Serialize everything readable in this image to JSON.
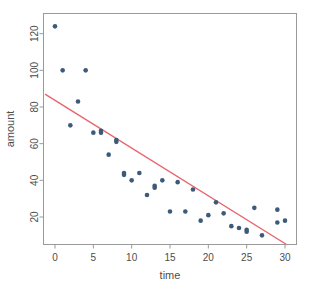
{
  "chart_data": {
    "type": "scatter",
    "title": "",
    "xlabel": "time",
    "ylabel": "amount",
    "xlim": [
      -1.5,
      31.5
    ],
    "ylim": [
      5,
      131
    ],
    "grid": false,
    "legend": null,
    "point_color": "#3d5a78",
    "line_color": "#e8646e",
    "frame_color": "#9a9a9a",
    "text_color": "#4d4d4d",
    "background": "#ffffff",
    "xticks": [
      0,
      5,
      10,
      15,
      20,
      25,
      30
    ],
    "xtick_labels": [
      "0",
      "5",
      "10",
      "15",
      "20",
      "25",
      "30"
    ],
    "yticks": [
      20,
      40,
      60,
      80,
      100,
      120
    ],
    "ytick_labels": [
      "20",
      "40",
      "60",
      "80",
      "100",
      "120"
    ],
    "x": [
      0,
      1,
      2,
      3,
      4,
      5,
      6,
      6,
      7,
      8,
      8,
      9,
      9,
      10,
      11,
      12,
      13,
      13,
      14,
      15,
      16,
      17,
      18,
      19,
      20,
      21,
      22,
      23,
      24,
      25,
      25,
      26,
      27,
      29,
      29,
      30
    ],
    "y": [
      124,
      100,
      70,
      83,
      100,
      66,
      67,
      66,
      54,
      61,
      62,
      43,
      44,
      40,
      44,
      32,
      36,
      37,
      40,
      23,
      39,
      23,
      35,
      18,
      21,
      28,
      22,
      15,
      14,
      12,
      13,
      25,
      10,
      24,
      17,
      18
    ],
    "series": [
      {
        "name": "observations",
        "marker": "circle",
        "points": [
          {
            "x": 0,
            "y": 124
          },
          {
            "x": 1,
            "y": 100
          },
          {
            "x": 2,
            "y": 70
          },
          {
            "x": 3,
            "y": 83
          },
          {
            "x": 4,
            "y": 100
          },
          {
            "x": 5,
            "y": 66
          },
          {
            "x": 6,
            "y": 67
          },
          {
            "x": 6,
            "y": 66
          },
          {
            "x": 7,
            "y": 54
          },
          {
            "x": 8,
            "y": 61
          },
          {
            "x": 8,
            "y": 62
          },
          {
            "x": 9,
            "y": 43
          },
          {
            "x": 9,
            "y": 44
          },
          {
            "x": 10,
            "y": 40
          },
          {
            "x": 11,
            "y": 44
          },
          {
            "x": 12,
            "y": 32
          },
          {
            "x": 13,
            "y": 36
          },
          {
            "x": 13,
            "y": 37
          },
          {
            "x": 14,
            "y": 40
          },
          {
            "x": 15,
            "y": 23
          },
          {
            "x": 16,
            "y": 39
          },
          {
            "x": 17,
            "y": 23
          },
          {
            "x": 18,
            "y": 35
          },
          {
            "x": 19,
            "y": 18
          },
          {
            "x": 20,
            "y": 21
          },
          {
            "x": 21,
            "y": 28
          },
          {
            "x": 22,
            "y": 22
          },
          {
            "x": 23,
            "y": 15
          },
          {
            "x": 24,
            "y": 14
          },
          {
            "x": 25,
            "y": 12
          },
          {
            "x": 25,
            "y": 13
          },
          {
            "x": 26,
            "y": 25
          },
          {
            "x": 27,
            "y": 10
          },
          {
            "x": 29,
            "y": 24
          },
          {
            "x": 29,
            "y": 17
          },
          {
            "x": 30,
            "y": 18
          }
        ]
      }
    ],
    "fit_line": {
      "name": "regression-line",
      "x_start": -1.3,
      "y_start": 87,
      "x_end": 30.2,
      "y_end": 5,
      "color": "#e8646e"
    }
  }
}
